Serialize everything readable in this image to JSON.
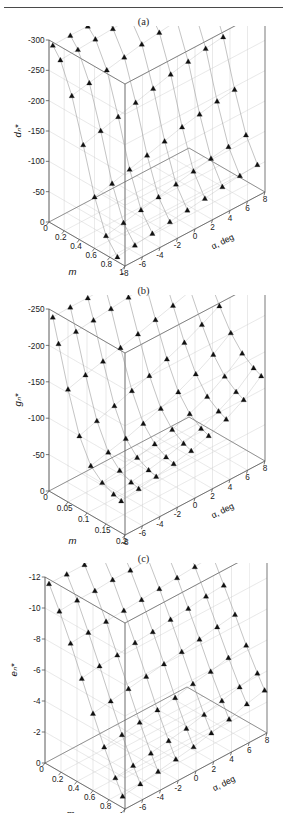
{
  "figure": {
    "top_rule": true,
    "header_ghost": "",
    "marker": "filled-triangle",
    "marker_color": "#111111",
    "line_color": "#8d8d8d",
    "grid_color": "#cfcfcf",
    "axis_color": "#555555",
    "background": "#ffffff"
  },
  "panels": [
    {
      "id": "a",
      "label": "(a)",
      "chart_data": {
        "type": "scatter",
        "title": "(a)",
        "projection": "3d-surface-mesh",
        "zlabel": "dₙ*",
        "xlabel": "m",
        "ylabel": "α, deg",
        "zticks": [
          "0",
          "-50",
          "-100",
          "-150",
          "-200",
          "-250",
          "-300"
        ],
        "zlim": [
          -300,
          0
        ],
        "xticks": [
          "0",
          "0.2",
          "0.4",
          "0.6",
          "0.8",
          "1"
        ],
        "xlim": [
          0,
          1
        ],
        "yticks": [
          "-8",
          "-6",
          "-4",
          "-2",
          "0",
          "2",
          "4",
          "6",
          "8"
        ],
        "ylim": [
          -8,
          8
        ],
        "grid": true,
        "legend": "none",
        "x": [
          0.05,
          0.15,
          0.3,
          0.45,
          0.6,
          0.75,
          0.9
        ],
        "series": [
          {
            "name": "α = -8",
            "values": [
              -5,
              -22,
              -70,
              -140,
              -215,
              -268,
              -292
            ]
          },
          {
            "name": "α = -6",
            "values": [
              -4,
              -20,
              -64,
              -132,
              -208,
              -262,
              -288
            ]
          },
          {
            "name": "α = -4",
            "values": [
              -4,
              -18,
              -58,
              -124,
              -200,
              -256,
              -284
            ]
          },
          {
            "name": "α = -2",
            "values": [
              -3,
              -16,
              -52,
              -116,
              -192,
              -250,
              -280
            ]
          },
          {
            "name": "α = 0",
            "values": [
              -3,
              -14,
              -46,
              -108,
              -184,
              -244,
              -276
            ]
          },
          {
            "name": "α = 2",
            "values": [
              -3,
              -13,
              -42,
              -100,
              -176,
              -238,
              -272
            ]
          },
          {
            "name": "α = 4",
            "values": [
              -2,
              -12,
              -38,
              -94,
              -170,
              -232,
              -268
            ]
          },
          {
            "name": "α = 6",
            "values": [
              -2,
              -11,
              -35,
              -88,
              -164,
              -228,
              -265
            ]
          },
          {
            "name": "α = 8",
            "values": [
              -2,
              -10,
              -32,
              -84,
              -160,
              -224,
              -262
            ]
          }
        ]
      }
    },
    {
      "id": "b",
      "label": "(b)",
      "chart_data": {
        "type": "scatter",
        "title": "(b)",
        "projection": "3d-surface-mesh",
        "zlabel": "gₙ*",
        "xlabel": "m",
        "ylabel": "α, deg",
        "zticks": [
          "0",
          "-50",
          "-100",
          "-150",
          "-200",
          "-250"
        ],
        "zlim": [
          -250,
          0
        ],
        "xticks": [
          "0",
          "0.05",
          "0.1",
          "0.15",
          "0.2"
        ],
        "xlim": [
          0,
          0.2
        ],
        "yticks": [
          "-8",
          "-6",
          "-4",
          "-2",
          "0",
          "2",
          "4",
          "6",
          "8"
        ],
        "ylim": [
          -8,
          8
        ],
        "grid": true,
        "legend": "none",
        "x": [
          0.01,
          0.025,
          0.05,
          0.08,
          0.11,
          0.14,
          0.17,
          0.19
        ],
        "series": [
          {
            "name": "α = -8",
            "values": [
              -8,
              -40,
              -95,
              -150,
              -182,
              -196,
              -203,
              -206
            ]
          },
          {
            "name": "α = -6",
            "values": [
              -7,
              -36,
              -88,
              -142,
              -176,
              -192,
              -199,
              -202
            ]
          },
          {
            "name": "α = -4",
            "values": [
              -7,
              -33,
              -82,
              -134,
              -170,
              -187,
              -195,
              -198
            ]
          },
          {
            "name": "α = -2",
            "values": [
              -6,
              -30,
              -76,
              -126,
              -162,
              -181,
              -190,
              -193
            ]
          },
          {
            "name": "α = 0",
            "values": [
              -6,
              -27,
              -70,
              -118,
              -154,
              -174,
              -184,
              -188
            ]
          },
          {
            "name": "α = 2",
            "values": [
              -5,
              -24,
              -63,
              -108,
              -144,
              -165,
              -176,
              -180
            ]
          },
          {
            "name": "α = 4",
            "values": [
              -5,
              -21,
              -56,
              -98,
              -132,
              -154,
              -165,
              -170
            ]
          },
          {
            "name": "α = 6",
            "values": [
              -4,
              -18,
              -49,
              -86,
              -118,
              -139,
              -151,
              -156
            ]
          },
          {
            "name": "α = 8",
            "values": [
              -4,
              -15,
              -41,
              -73,
              -101,
              -120,
              -131,
              -136
            ]
          }
        ]
      }
    },
    {
      "id": "c",
      "label": "(c)",
      "chart_data": {
        "type": "scatter",
        "title": "(c)",
        "projection": "3d-surface-mesh",
        "zlabel": "eₙ*",
        "xlabel": "m",
        "ylabel": "α, deg",
        "zticks": [
          "0",
          "-2",
          "-4",
          "-6",
          "-8",
          "-10",
          "-12"
        ],
        "zlim": [
          -13,
          0
        ],
        "xticks": [
          "0",
          "0.2",
          "0.4",
          "0.6",
          "0.8",
          "1"
        ],
        "xlim": [
          0,
          1
        ],
        "yticks": [
          "-8",
          "-6",
          "-4",
          "-2",
          "0",
          "2",
          "4",
          "6",
          "8"
        ],
        "ylim": [
          -8,
          8
        ],
        "grid": true,
        "legend": "none",
        "x": [
          0.05,
          0.18,
          0.32,
          0.46,
          0.6,
          0.74,
          0.88,
          0.97
        ],
        "series": [
          {
            "name": "α = -8",
            "values": [
              -0.3,
              -1.8,
              -3.6,
              -5.6,
              -7.6,
              -9.5,
              -11.2,
              -12.2
            ]
          },
          {
            "name": "α = -6",
            "values": [
              -0.3,
              -1.7,
              -3.5,
              -5.4,
              -7.4,
              -9.3,
              -11.0,
              -12.0
            ]
          },
          {
            "name": "α = -4",
            "values": [
              -0.3,
              -1.7,
              -3.4,
              -5.3,
              -7.2,
              -9.1,
              -10.8,
              -11.8
            ]
          },
          {
            "name": "α = -2",
            "values": [
              -0.3,
              -1.6,
              -3.3,
              -5.1,
              -7.0,
              -8.9,
              -10.6,
              -11.6
            ]
          },
          {
            "name": "α = 0",
            "values": [
              -0.3,
              -1.6,
              -3.2,
              -5.0,
              -6.8,
              -8.7,
              -10.4,
              -11.4
            ]
          },
          {
            "name": "α = 2",
            "values": [
              -0.3,
              -1.5,
              -3.1,
              -4.8,
              -6.6,
              -8.4,
              -10.1,
              -11.1
            ]
          },
          {
            "name": "α = 4",
            "values": [
              -0.2,
              -1.5,
              -3.0,
              -4.7,
              -6.4,
              -8.2,
              -9.8,
              -10.8
            ]
          },
          {
            "name": "α = 6",
            "values": [
              -0.2,
              -1.4,
              -2.9,
              -4.5,
              -6.2,
              -7.9,
              -9.5,
              -10.4
            ]
          },
          {
            "name": "α = 8",
            "values": [
              -0.2,
              -1.4,
              -2.8,
              -4.4,
              -6.0,
              -7.7,
              -9.2,
              -10.1
            ]
          }
        ]
      }
    }
  ]
}
